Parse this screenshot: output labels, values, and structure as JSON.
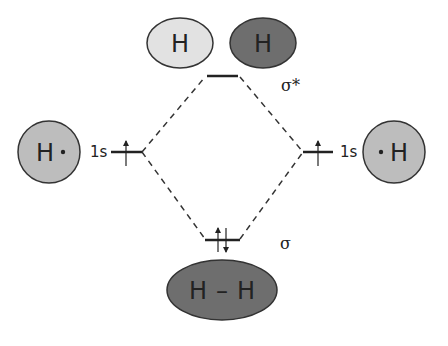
{
  "diagram": {
    "type": "molecular-orbital-diagram",
    "colors": {
      "light_lobe": "#e2e2e2",
      "dark_lobe": "#6e6e6e",
      "atom_fill": "#bdbdbd",
      "line": "#222222"
    },
    "antibonding": {
      "label": "σ*",
      "lobe_left": "H",
      "lobe_right": "H"
    },
    "left_atom": {
      "symbol": "H",
      "radical_dot": "•",
      "orbital_label": "1s",
      "electrons": "↑"
    },
    "right_atom": {
      "symbol": "H",
      "radical_dot": "•",
      "orbital_label": "1s",
      "electrons": "↑"
    },
    "bonding": {
      "label": "σ",
      "electrons": "↑↓",
      "molecule_left": "H",
      "bond": "–",
      "molecule_right": "H"
    }
  }
}
